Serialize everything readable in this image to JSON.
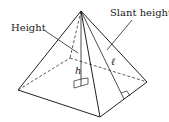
{
  "diagram": {
    "labels": {
      "height": "Height",
      "slant_height": "Slant height",
      "h": "h",
      "l": "ℓ"
    },
    "colors": {
      "stroke": "#222222",
      "background": "#ffffff"
    }
  }
}
